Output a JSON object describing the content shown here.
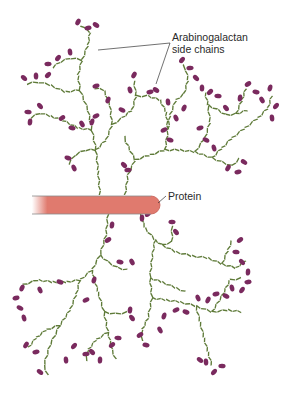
{
  "labels": {
    "side_chains_line1": "Arabinogalactan",
    "side_chains_line2": "side chains",
    "protein": "Protein"
  },
  "colors": {
    "chain": "#5e7a38",
    "terminal": "#7a2a5e",
    "protein_fill": "#e07a6e",
    "protein_edge": "#c45a50",
    "leader": "#333333",
    "text": "#2a2a2a"
  },
  "protein_rod": {
    "x1": 32,
    "x2": 160,
    "y": 196,
    "height": 18
  },
  "leaders": [
    {
      "from": [
        170,
        43
      ],
      "to": [
        98,
        50
      ]
    },
    {
      "from": [
        170,
        43
      ],
      "to": [
        156,
        84
      ]
    },
    {
      "from": [
        166,
        196
      ],
      "to": [
        158,
        203
      ]
    }
  ],
  "chains": [
    [
      [
        100,
        195
      ],
      [
        98,
        170
      ],
      [
        96,
        150
      ],
      [
        92,
        130
      ],
      [
        88,
        110
      ],
      [
        80,
        90
      ],
      [
        78,
        75
      ],
      [
        82,
        60
      ],
      [
        88,
        45
      ],
      [
        90,
        32
      ],
      [
        80,
        25
      ]
    ],
    [
      [
        82,
        60
      ],
      [
        70,
        58
      ],
      [
        60,
        62
      ],
      [
        52,
        68
      ]
    ],
    [
      [
        80,
        90
      ],
      [
        65,
        92
      ],
      [
        50,
        85
      ],
      [
        38,
        82
      ],
      [
        26,
        84
      ]
    ],
    [
      [
        92,
        130
      ],
      [
        78,
        128
      ],
      [
        62,
        120
      ],
      [
        50,
        116
      ],
      [
        40,
        113
      ],
      [
        30,
        118
      ]
    ],
    [
      [
        96,
        150
      ],
      [
        85,
        150
      ],
      [
        75,
        155
      ],
      [
        68,
        165
      ]
    ],
    [
      [
        96,
        150
      ],
      [
        106,
        140
      ],
      [
        112,
        125
      ],
      [
        110,
        105
      ],
      [
        104,
        90
      ],
      [
        94,
        88
      ]
    ],
    [
      [
        112,
        125
      ],
      [
        122,
        118
      ],
      [
        132,
        110
      ],
      [
        136,
        96
      ],
      [
        134,
        80
      ]
    ],
    [
      [
        136,
        96
      ],
      [
        148,
        96
      ],
      [
        160,
        100
      ],
      [
        166,
        112
      ],
      [
        168,
        130
      ]
    ],
    [
      [
        125,
        195
      ],
      [
        128,
        175
      ],
      [
        135,
        160
      ],
      [
        150,
        155
      ],
      [
        165,
        150
      ],
      [
        180,
        150
      ],
      [
        195,
        152
      ],
      [
        212,
        158
      ]
    ],
    [
      [
        165,
        150
      ],
      [
        168,
        130
      ],
      [
        170,
        115
      ],
      [
        176,
        100
      ],
      [
        184,
        94
      ]
    ],
    [
      [
        184,
        94
      ],
      [
        188,
        80
      ],
      [
        186,
        70
      ],
      [
        182,
        64
      ]
    ],
    [
      [
        195,
        152
      ],
      [
        205,
        138
      ],
      [
        210,
        122
      ],
      [
        208,
        105
      ],
      [
        205,
        92
      ]
    ],
    [
      [
        208,
        105
      ],
      [
        218,
        110
      ],
      [
        226,
        115
      ],
      [
        236,
        114
      ],
      [
        248,
        110
      ]
    ],
    [
      [
        236,
        114
      ],
      [
        242,
        100
      ],
      [
        246,
        88
      ]
    ],
    [
      [
        212,
        158
      ],
      [
        222,
        162
      ],
      [
        232,
        166
      ],
      [
        240,
        158
      ]
    ],
    [
      [
        212,
        158
      ],
      [
        222,
        148
      ],
      [
        232,
        138
      ],
      [
        245,
        128
      ],
      [
        258,
        118
      ],
      [
        268,
        108
      ],
      [
        272,
        95
      ]
    ],
    [
      [
        135,
        160
      ],
      [
        130,
        150
      ],
      [
        126,
        142
      ],
      [
        124,
        135
      ]
    ],
    [
      [
        108,
        214
      ],
      [
        106,
        235
      ],
      [
        100,
        255
      ],
      [
        92,
        270
      ],
      [
        80,
        280
      ],
      [
        66,
        282
      ],
      [
        52,
        282
      ],
      [
        38,
        280
      ],
      [
        22,
        285
      ]
    ],
    [
      [
        100,
        255
      ],
      [
        108,
        262
      ],
      [
        118,
        268
      ],
      [
        128,
        270
      ]
    ],
    [
      [
        80,
        280
      ],
      [
        76,
        295
      ],
      [
        70,
        310
      ],
      [
        60,
        325
      ],
      [
        50,
        345
      ],
      [
        44,
        365
      ],
      [
        48,
        376
      ]
    ],
    [
      [
        60,
        325
      ],
      [
        46,
        330
      ],
      [
        36,
        338
      ],
      [
        28,
        348
      ]
    ],
    [
      [
        92,
        270
      ],
      [
        98,
        292
      ],
      [
        104,
        312
      ],
      [
        108,
        332
      ],
      [
        112,
        350
      ],
      [
        116,
        360
      ]
    ],
    [
      [
        104,
        312
      ],
      [
        116,
        314
      ],
      [
        128,
        312
      ]
    ],
    [
      [
        108,
        332
      ],
      [
        96,
        340
      ],
      [
        88,
        350
      ],
      [
        86,
        362
      ]
    ],
    [
      [
        140,
        214
      ],
      [
        145,
        228
      ],
      [
        155,
        240
      ],
      [
        162,
        245
      ],
      [
        172,
        242
      ],
      [
        172,
        225
      ]
    ],
    [
      [
        155,
        240
      ],
      [
        152,
        258
      ],
      [
        150,
        278
      ],
      [
        152,
        298
      ],
      [
        148,
        318
      ],
      [
        142,
        330
      ],
      [
        142,
        342
      ]
    ],
    [
      [
        152,
        298
      ],
      [
        166,
        300
      ],
      [
        180,
        302
      ],
      [
        196,
        306
      ],
      [
        212,
        312
      ],
      [
        228,
        310
      ],
      [
        242,
        312
      ]
    ],
    [
      [
        196,
        306
      ],
      [
        200,
        322
      ],
      [
        204,
        338
      ],
      [
        208,
        352
      ],
      [
        212,
        366
      ]
    ],
    [
      [
        212,
        312
      ],
      [
        222,
        296
      ],
      [
        230,
        280
      ],
      [
        242,
        278
      ]
    ],
    [
      [
        162,
        245
      ],
      [
        176,
        252
      ],
      [
        192,
        256
      ],
      [
        208,
        258
      ],
      [
        222,
        264
      ],
      [
        236,
        268
      ],
      [
        246,
        260
      ]
    ],
    [
      [
        222,
        264
      ],
      [
        228,
        250
      ],
      [
        232,
        240
      ]
    ],
    [
      [
        150,
        278
      ],
      [
        162,
        282
      ],
      [
        176,
        288
      ],
      [
        186,
        292
      ]
    ]
  ],
  "terminals": [
    [
      78,
      22
    ],
    [
      88,
      28
    ],
    [
      96,
      25
    ],
    [
      70,
      52
    ],
    [
      58,
      58
    ],
    [
      48,
      64
    ],
    [
      24,
      78
    ],
    [
      36,
      76
    ],
    [
      48,
      75
    ],
    [
      28,
      112
    ],
    [
      40,
      106
    ],
    [
      30,
      122
    ],
    [
      62,
      118
    ],
    [
      72,
      128
    ],
    [
      82,
      124
    ],
    [
      92,
      122
    ],
    [
      96,
      116
    ],
    [
      68,
      158
    ],
    [
      74,
      168
    ],
    [
      108,
      100
    ],
    [
      96,
      86
    ],
    [
      122,
      110
    ],
    [
      130,
      90
    ],
    [
      134,
      75
    ],
    [
      150,
      92
    ],
    [
      156,
      90
    ],
    [
      168,
      102
    ],
    [
      182,
      60
    ],
    [
      190,
      68
    ],
    [
      196,
      78
    ],
    [
      202,
      88
    ],
    [
      210,
      92
    ],
    [
      218,
      96
    ],
    [
      226,
      108
    ],
    [
      240,
      98
    ],
    [
      248,
      84
    ],
    [
      256,
      92
    ],
    [
      262,
      100
    ],
    [
      270,
      88
    ],
    [
      164,
      130
    ],
    [
      170,
      140
    ],
    [
      176,
      118
    ],
    [
      184,
      108
    ],
    [
      200,
      128
    ],
    [
      206,
      140
    ],
    [
      214,
      148
    ],
    [
      228,
      168
    ],
    [
      238,
      172
    ],
    [
      244,
      162
    ],
    [
      272,
      118
    ],
    [
      276,
      106
    ],
    [
      128,
      170
    ],
    [
      124,
      165
    ],
    [
      142,
      218
    ],
    [
      148,
      214
    ],
    [
      172,
      222
    ],
    [
      176,
      232
    ],
    [
      112,
      225
    ],
    [
      108,
      240
    ],
    [
      120,
      262
    ],
    [
      132,
      262
    ],
    [
      94,
      280
    ],
    [
      86,
      300
    ],
    [
      60,
      282
    ],
    [
      40,
      290
    ],
    [
      22,
      288
    ],
    [
      16,
      298
    ],
    [
      20,
      308
    ],
    [
      24,
      318
    ],
    [
      26,
      345
    ],
    [
      36,
      352
    ],
    [
      40,
      372
    ],
    [
      66,
      360
    ],
    [
      74,
      346
    ],
    [
      86,
      354
    ],
    [
      92,
      352
    ],
    [
      100,
      360
    ],
    [
      112,
      345
    ],
    [
      118,
      338
    ],
    [
      132,
      318
    ],
    [
      130,
      310
    ],
    [
      140,
      335
    ],
    [
      146,
      345
    ],
    [
      160,
      330
    ],
    [
      164,
      316
    ],
    [
      176,
      310
    ],
    [
      186,
      312
    ],
    [
      198,
      298
    ],
    [
      208,
      300
    ],
    [
      216,
      294
    ],
    [
      226,
      296
    ],
    [
      232,
      288
    ],
    [
      242,
      290
    ],
    [
      248,
      282
    ],
    [
      200,
      360
    ],
    [
      206,
      362
    ],
    [
      214,
      372
    ],
    [
      222,
      366
    ],
    [
      242,
      262
    ],
    [
      248,
      272
    ],
    [
      240,
      240
    ],
    [
      236,
      252
    ]
  ]
}
